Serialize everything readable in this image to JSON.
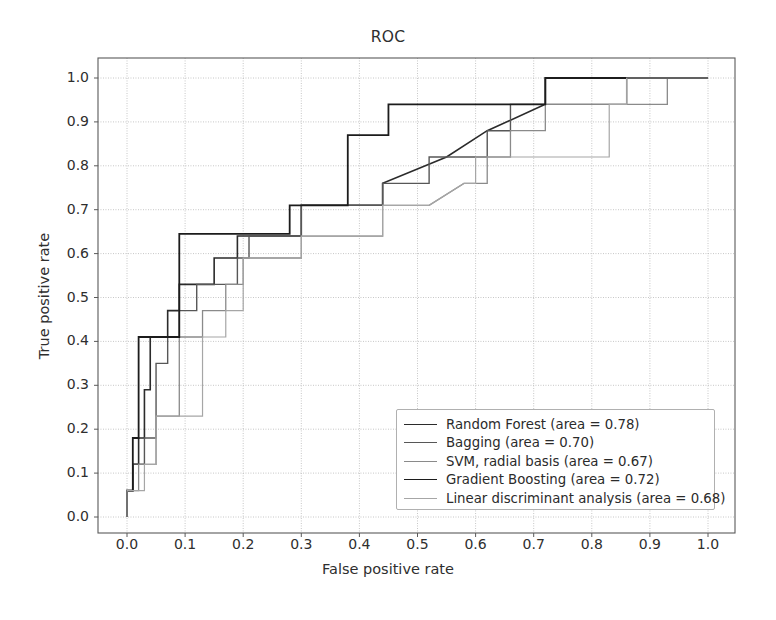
{
  "chart_data": {
    "type": "line",
    "title": "ROC",
    "xlabel": "False positive rate",
    "ylabel": "True positive rate",
    "xlim": [
      0.0,
      1.0
    ],
    "ylim": [
      0.0,
      1.0
    ],
    "grid": true,
    "legend_position": "lower right",
    "xticks": [
      "0.0",
      "0.1",
      "0.2",
      "0.3",
      "0.4",
      "0.5",
      "0.6",
      "0.7",
      "0.8",
      "0.9",
      "1.0"
    ],
    "yticks": [
      "0.0",
      "0.1",
      "0.2",
      "0.3",
      "0.4",
      "0.5",
      "0.6",
      "0.7",
      "0.8",
      "0.9",
      "1.0"
    ],
    "xtick_values": [
      0.0,
      0.1,
      0.2,
      0.3,
      0.4,
      0.5,
      0.6,
      0.7,
      0.8,
      0.9,
      1.0
    ],
    "ytick_values": [
      0.0,
      0.1,
      0.2,
      0.3,
      0.4,
      0.5,
      0.6,
      0.7,
      0.8,
      0.9,
      1.0
    ],
    "series": [
      {
        "name": "Random Forest",
        "area": 0.78,
        "legend_label": "Random Forest (area = 0.78)",
        "color": "#2b2b2b",
        "width": 1.6,
        "x": [
          0.0,
          0.0,
          0.01,
          0.01,
          0.02,
          0.02,
          0.03,
          0.03,
          0.04,
          0.04,
          0.05,
          0.05,
          0.07,
          0.07,
          0.09,
          0.09,
          0.13,
          0.13,
          0.15,
          0.15,
          0.17,
          0.17,
          0.19,
          0.19,
          0.21,
          0.21,
          0.26,
          0.26,
          0.3,
          0.3,
          0.34,
          0.34,
          0.35,
          0.35,
          0.44,
          0.44,
          0.55,
          0.62,
          0.72,
          0.72,
          0.83,
          0.83,
          1.0
        ],
        "y": [
          0.0,
          0.06,
          0.06,
          0.12,
          0.12,
          0.18,
          0.18,
          0.29,
          0.29,
          0.41,
          0.41,
          0.41,
          0.41,
          0.47,
          0.47,
          0.53,
          0.53,
          0.53,
          0.53,
          0.59,
          0.59,
          0.59,
          0.59,
          0.64,
          0.64,
          0.64,
          0.64,
          0.64,
          0.64,
          0.71,
          0.71,
          0.71,
          0.71,
          0.71,
          0.71,
          0.76,
          0.82,
          0.88,
          0.94,
          1.0,
          1.0,
          1.0,
          1.0
        ]
      },
      {
        "name": "Bagging",
        "area": 0.7,
        "legend_label": "Bagging (area = 0.70)",
        "color": "#575757",
        "width": 1.4,
        "x": [
          0.0,
          0.0,
          0.01,
          0.01,
          0.03,
          0.03,
          0.05,
          0.05,
          0.07,
          0.07,
          0.09,
          0.09,
          0.12,
          0.12,
          0.15,
          0.15,
          0.19,
          0.19,
          0.21,
          0.21,
          0.26,
          0.26,
          0.3,
          0.3,
          0.36,
          0.36,
          0.44,
          0.44,
          0.52,
          0.52,
          0.62,
          0.62,
          0.66,
          0.66,
          0.83,
          0.83,
          0.86,
          0.86,
          1.0
        ],
        "y": [
          0.0,
          0.06,
          0.06,
          0.12,
          0.12,
          0.18,
          0.18,
          0.35,
          0.35,
          0.41,
          0.41,
          0.47,
          0.47,
          0.53,
          0.53,
          0.53,
          0.53,
          0.59,
          0.59,
          0.64,
          0.64,
          0.64,
          0.64,
          0.71,
          0.71,
          0.71,
          0.71,
          0.76,
          0.76,
          0.82,
          0.82,
          0.88,
          0.88,
          0.94,
          0.94,
          0.94,
          0.94,
          1.0,
          1.0
        ]
      },
      {
        "name": "SVM, radial basis",
        "area": 0.67,
        "legend_label": "SVM, radial basis (area = 0.67)",
        "color": "#8a8a8a",
        "width": 1.3,
        "x": [
          0.0,
          0.0,
          0.02,
          0.02,
          0.05,
          0.05,
          0.09,
          0.09,
          0.13,
          0.13,
          0.17,
          0.17,
          0.2,
          0.2,
          0.26,
          0.26,
          0.3,
          0.3,
          0.38,
          0.38,
          0.44,
          0.44,
          0.52,
          0.58,
          0.62,
          0.62,
          0.66,
          0.66,
          0.72,
          0.72,
          0.78,
          0.78,
          0.83,
          0.83,
          0.93,
          0.93,
          1.0
        ],
        "y": [
          0.0,
          0.06,
          0.06,
          0.12,
          0.12,
          0.23,
          0.23,
          0.41,
          0.41,
          0.47,
          0.47,
          0.53,
          0.53,
          0.59,
          0.59,
          0.59,
          0.59,
          0.64,
          0.64,
          0.64,
          0.64,
          0.71,
          0.71,
          0.76,
          0.76,
          0.82,
          0.82,
          0.88,
          0.88,
          0.94,
          0.94,
          0.94,
          0.94,
          0.94,
          0.94,
          1.0,
          1.0
        ]
      },
      {
        "name": "Gradient Boosting",
        "area": 0.72,
        "legend_label": "Gradient Boosting (area = 0.72)",
        "color": "#1c1c1c",
        "width": 1.8,
        "x": [
          0.0,
          0.0,
          0.01,
          0.01,
          0.02,
          0.02,
          0.04,
          0.04,
          0.09,
          0.09,
          0.26,
          0.26,
          0.28,
          0.28,
          0.33,
          0.33,
          0.38,
          0.38,
          0.45,
          0.45,
          0.52,
          0.52,
          0.6,
          0.6,
          0.72,
          0.72,
          1.0
        ],
        "y": [
          0.0,
          0.06,
          0.06,
          0.18,
          0.18,
          0.41,
          0.41,
          0.41,
          0.41,
          0.645,
          0.645,
          0.645,
          0.645,
          0.71,
          0.71,
          0.71,
          0.71,
          0.87,
          0.87,
          0.94,
          0.94,
          0.94,
          0.94,
          0.94,
          0.94,
          1.0,
          1.0
        ]
      },
      {
        "name": "Linear discriminant analysis",
        "area": 0.68,
        "legend_label": "Linear discriminant analysis (area = 0.68)",
        "color": "#a6a6a6",
        "width": 1.2,
        "x": [
          0.0,
          0.0,
          0.03,
          0.03,
          0.05,
          0.05,
          0.09,
          0.09,
          0.13,
          0.13,
          0.17,
          0.17,
          0.2,
          0.2,
          0.26,
          0.26,
          0.3,
          0.3,
          0.36,
          0.36,
          0.44,
          0.44,
          0.52,
          0.58,
          0.6,
          0.6,
          0.66,
          0.66,
          0.83,
          0.83,
          0.86,
          0.86,
          1.0
        ],
        "y": [
          0.0,
          0.06,
          0.06,
          0.12,
          0.12,
          0.23,
          0.23,
          0.23,
          0.23,
          0.41,
          0.41,
          0.47,
          0.47,
          0.59,
          0.59,
          0.59,
          0.59,
          0.64,
          0.64,
          0.64,
          0.64,
          0.71,
          0.71,
          0.76,
          0.76,
          0.82,
          0.82,
          0.82,
          0.82,
          0.94,
          0.94,
          1.0,
          1.0
        ]
      }
    ]
  },
  "axes_style": {
    "grid_color": "#b0b0b0",
    "spine_color": "#5a5a5a",
    "background": "#ffffff"
  }
}
